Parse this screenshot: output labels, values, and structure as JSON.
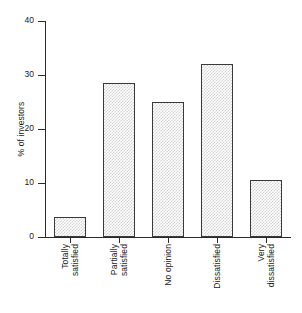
{
  "chart_data": {
    "type": "bar",
    "title": "",
    "subtitle": "",
    "xlabel": "",
    "ylabel": "% of investors",
    "categories": [
      "Totally satisfied",
      "Partially satisfied",
      "No opinion",
      "Dissatisfied",
      "Very dissatisfied"
    ],
    "category_lines": [
      [
        "Totally",
        "satisfied"
      ],
      [
        "Partially",
        "satisfied"
      ],
      [
        "No opinion"
      ],
      [
        "Dissatisfied"
      ],
      [
        "Very",
        "dissatisfied"
      ]
    ],
    "values": [
      3.7,
      28.5,
      25.0,
      32.0,
      10.6
    ],
    "ylim": [
      0,
      40
    ],
    "yticks": [
      0,
      10,
      20,
      30,
      40
    ],
    "ytick_labels": [
      "0",
      "10",
      "20",
      "30",
      "40"
    ],
    "grid": false,
    "legend": false,
    "bar_fill": "#d2d2d2",
    "bar_edge": "#3a3a3a",
    "axis_color": "#2b2b2b",
    "background": "#ffffff"
  },
  "axis": {
    "y_title": "% of investors"
  }
}
